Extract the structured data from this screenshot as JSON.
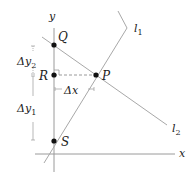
{
  "diagram": {
    "axes": {
      "x_label": "x",
      "y_label": "y"
    },
    "points": [
      {
        "id": "Q",
        "label": "Q"
      },
      {
        "id": "R",
        "label": "R"
      },
      {
        "id": "P",
        "label": "P"
      },
      {
        "id": "S",
        "label": "S"
      }
    ],
    "lines": [
      {
        "id": "l1",
        "label": "l",
        "sub": "1"
      },
      {
        "id": "l2",
        "label": "l",
        "sub": "2"
      }
    ],
    "measures": {
      "dy2": {
        "prefix": "Δy",
        "sub": "2"
      },
      "dy1": {
        "prefix": "Δy",
        "sub": "1"
      },
      "dx": {
        "label": "Δx"
      }
    },
    "colors": {
      "line": "#9a9a9a",
      "point": "#111111",
      "text": "#222222"
    }
  }
}
